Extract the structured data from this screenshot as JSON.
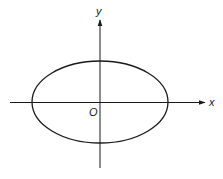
{
  "diagram": {
    "type": "ellipse-on-axes",
    "labels": {
      "y_axis": "y",
      "x_axis": "x",
      "origin": "O"
    },
    "colors": {
      "stroke": "#1a1a1a",
      "background": "#ffffff"
    }
  }
}
